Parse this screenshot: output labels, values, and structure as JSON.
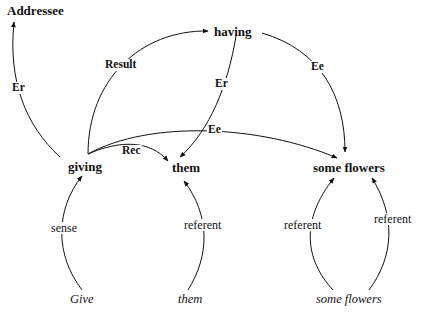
{
  "diagram": {
    "nodes": {
      "addressee": "Addressee",
      "having": "having",
      "giving": "giving",
      "them": "them",
      "some_flowers": "some flowers"
    },
    "words": {
      "give": "Give",
      "them": "them",
      "some_flowers": "some flowers"
    },
    "edge_labels": {
      "giving_addressee": "Er",
      "giving_having": "Result",
      "having_them": "Er",
      "having_flowers": "Ee",
      "giving_flowers": "Ee",
      "giving_them": "Rec",
      "give_giving": "sense",
      "them_word_them": "referent",
      "flowers_left": "referent",
      "flowers_right": "referent"
    },
    "edges": [
      {
        "from": "giving",
        "to": "Addressee",
        "label": "Er"
      },
      {
        "from": "giving",
        "to": "having",
        "label": "Result"
      },
      {
        "from": "having",
        "to": "them",
        "label": "Er"
      },
      {
        "from": "having",
        "to": "some flowers",
        "label": "Ee"
      },
      {
        "from": "giving",
        "to": "some flowers",
        "label": "Ee"
      },
      {
        "from": "giving",
        "to": "them",
        "label": "Rec"
      },
      {
        "from": "Give",
        "to": "giving",
        "label": "sense"
      },
      {
        "from": "them (word)",
        "to": "them",
        "label": "referent"
      },
      {
        "from": "some flowers (word)",
        "to": "some flowers",
        "label": "referent"
      },
      {
        "from": "some flowers (word)",
        "to": "some flowers",
        "label": "referent"
      }
    ]
  }
}
